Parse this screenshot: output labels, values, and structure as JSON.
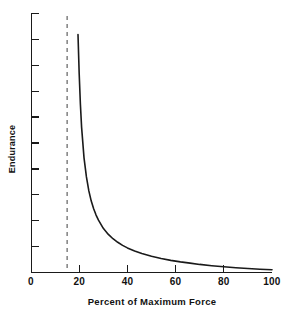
{
  "chart_data": {
    "type": "line",
    "title": "",
    "subtitle": "",
    "xlabel": "Percent of Maximum Force",
    "ylabel": "Endurance",
    "xlim": [
      0,
      100
    ],
    "ylim": [
      0,
      100
    ],
    "grid": false,
    "legend": null,
    "x_ticks": [
      0,
      20,
      40,
      60,
      80,
      100
    ],
    "x_tick_labels": [
      "0",
      "20",
      "40",
      "60",
      "80",
      "100"
    ],
    "y_ticks": [
      0,
      10,
      20,
      30,
      40,
      50,
      60,
      70,
      80,
      90,
      100
    ],
    "y_tick_labels": [
      "",
      "",
      "",
      "",
      "",
      "",
      "",
      "",
      "",
      "",
      ""
    ],
    "series": [
      {
        "name": "Endurance curve",
        "type": "line",
        "color": "#1a1a1a",
        "linewidth": 1.6,
        "x": [
          19.5,
          20,
          20.5,
          21,
          22,
          23,
          24,
          25,
          26,
          27,
          28,
          30,
          32,
          34,
          36,
          38,
          40,
          43,
          46,
          50,
          54,
          58,
          62,
          66,
          70,
          75,
          80,
          85,
          90,
          95,
          100
        ],
        "y": [
          93.5,
          78,
          66,
          57,
          45,
          37.5,
          32,
          28,
          25,
          22.5,
          20.5,
          17.3,
          15,
          13.2,
          11.8,
          10.6,
          9.6,
          8.4,
          7.4,
          6.3,
          5.4,
          4.7,
          4.1,
          3.6,
          3.1,
          2.6,
          2.2,
          1.8,
          1.5,
          1.2,
          1.0
        ]
      }
    ],
    "annotations": [
      {
        "name": "fatigue-threshold-line",
        "type": "vertical-dashed-line",
        "x": 15,
        "color": "#808080",
        "dash": "4,4",
        "label": ""
      }
    ]
  },
  "axes": {
    "x_axis_label": "Percent of Maximum Force",
    "y_axis_label": "Endurance",
    "x_tick_labels": [
      "0",
      "20",
      "40",
      "60",
      "80",
      "100"
    ],
    "axis_color": "#1a1a1a"
  },
  "colors": {
    "background": "#ffffff",
    "curve": "#1a1a1a",
    "axis": "#1a1a1a",
    "dashed_line": "#808080",
    "text": "#111111"
  }
}
